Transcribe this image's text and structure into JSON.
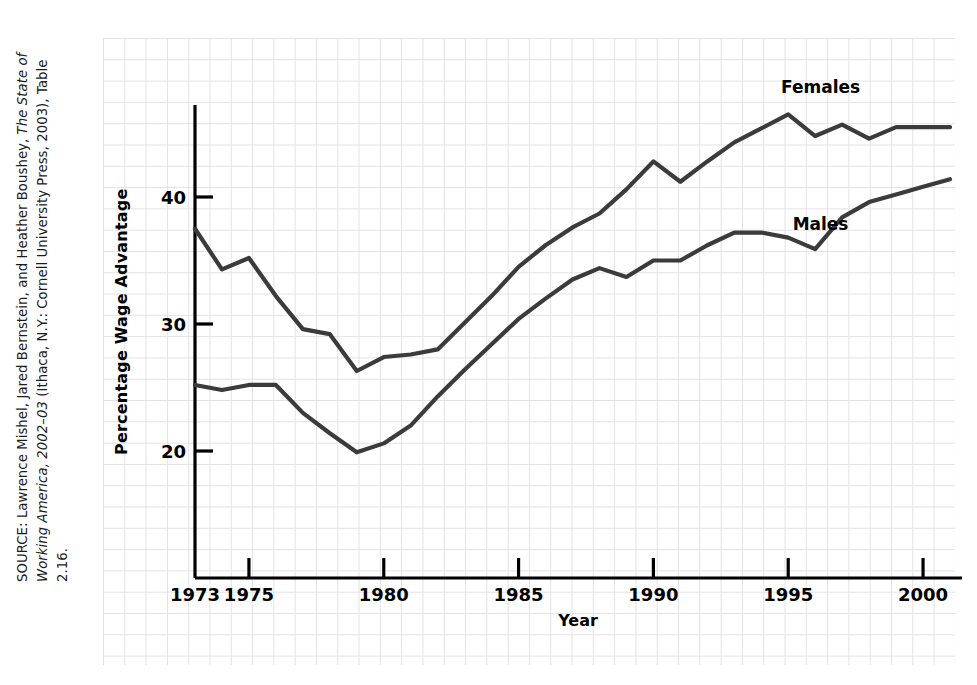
{
  "source_note": {
    "prefix": "SOURCE: Lawrence Mishel, Jared Bernstein, and Heather Boushey, ",
    "italic_title": "The State of Working America, 2002–03 ",
    "suffix": "(Ithaca, N.Y.: Cornell University Press, 2003), Table 2.16."
  },
  "chart_data": {
    "type": "line",
    "title": "",
    "xlabel": "Year",
    "ylabel": "Percentage Wage Advantage",
    "xlim": [
      1973,
      2001
    ],
    "ylim": [
      13.5,
      49.5
    ],
    "grid": true,
    "grid_style": "graph-paper",
    "legend_position": "inline-right",
    "x_ticks": [
      1973,
      1975,
      1980,
      1985,
      1990,
      1995,
      2000
    ],
    "x_tick_labels": [
      "1973",
      "1975",
      "1980",
      "1985",
      "1990",
      "1995",
      "2000"
    ],
    "y_ticks": [
      20,
      30,
      40
    ],
    "y_tick_labels": [
      "20",
      "30",
      "40"
    ],
    "line_color": "#3b3b3b",
    "line_width": 4.2,
    "x": [
      1973,
      1974,
      1975,
      1976,
      1977,
      1978,
      1979,
      1980,
      1981,
      1982,
      1983,
      1984,
      1985,
      1986,
      1987,
      1988,
      1989,
      1990,
      1991,
      1992,
      1993,
      1994,
      1995,
      1996,
      1997,
      1998,
      1999,
      2000,
      2001
    ],
    "series": [
      {
        "name": "Females",
        "label": "Females",
        "values": [
          37.5,
          34.3,
          35.2,
          32.2,
          29.6,
          29.2,
          26.3,
          27.4,
          27.6,
          28.0,
          30.1,
          32.2,
          34.5,
          36.2,
          37.6,
          38.7,
          40.6,
          42.8,
          41.2,
          42.8,
          44.3,
          45.4,
          46.5,
          44.8,
          45.7,
          44.6,
          45.5,
          45.5,
          45.5
        ]
      },
      {
        "name": "Males",
        "label": "Males",
        "values": [
          25.2,
          24.8,
          25.2,
          25.2,
          23.0,
          21.4,
          19.9,
          20.6,
          22.0,
          24.3,
          26.4,
          28.4,
          30.4,
          32.0,
          33.5,
          34.4,
          33.7,
          35.0,
          35.0,
          36.2,
          37.2,
          37.2,
          36.8,
          35.9,
          38.4,
          39.6,
          40.2,
          40.8,
          41.4
        ]
      }
    ],
    "annotations": [
      {
        "text": "Females",
        "x": 1996.2,
        "y": 48.2
      },
      {
        "text": "Males",
        "x": 1996.2,
        "y": 37.4
      }
    ]
  }
}
